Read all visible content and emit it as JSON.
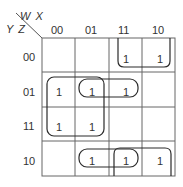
{
  "kmap": {
    "col_var_label": "W X",
    "row_var_label": "Y Z",
    "columns": [
      "00",
      "01",
      "11",
      "10"
    ],
    "rows": [
      "00",
      "01",
      "11",
      "10"
    ],
    "cells": [
      [
        "",
        "",
        "1",
        "1"
      ],
      [
        "1",
        "1",
        "1",
        ""
      ],
      [
        "1",
        "1",
        "",
        ""
      ],
      [
        "",
        "1",
        "1",
        "1"
      ]
    ],
    "groups": [
      {
        "name": "row00-cols11-10",
        "cells": [
          [
            0,
            2
          ],
          [
            0,
            3
          ]
        ]
      },
      {
        "name": "quad-rows01-11-cols00-01",
        "cells": [
          [
            1,
            0
          ],
          [
            1,
            1
          ],
          [
            2,
            0
          ],
          [
            2,
            1
          ]
        ]
      },
      {
        "name": "row01-cols01-11",
        "cells": [
          [
            1,
            1
          ],
          [
            1,
            2
          ]
        ]
      },
      {
        "name": "row10-cols01-11",
        "cells": [
          [
            3,
            1
          ],
          [
            3,
            2
          ]
        ]
      },
      {
        "name": "row10-cols11-10",
        "cells": [
          [
            3,
            2
          ],
          [
            3,
            3
          ]
        ]
      }
    ],
    "line_color": "#555555",
    "group_color": "#2a2a2a"
  }
}
